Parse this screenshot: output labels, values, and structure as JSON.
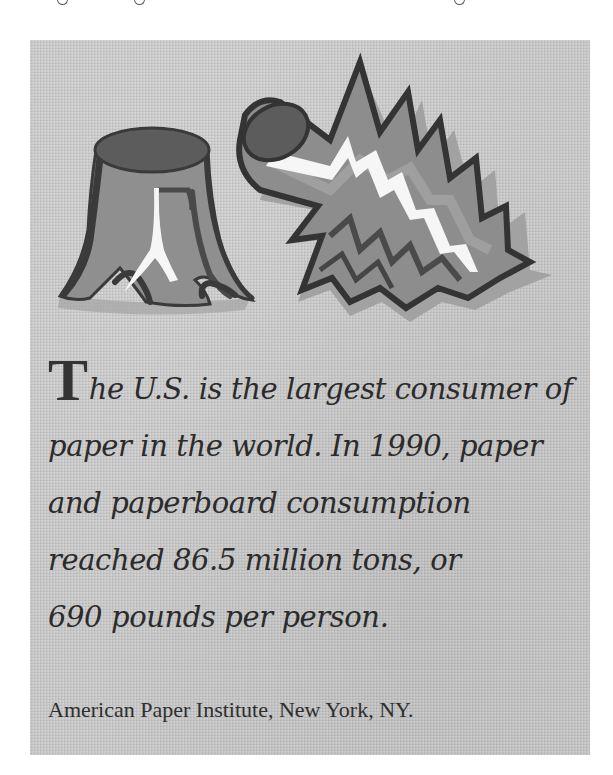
{
  "page": {
    "background_color": "#ffffff"
  },
  "panel": {
    "background_color": "#c9c9c9",
    "illustration": {
      "description": "Cartoon tree stump beside a felled log with jagged splintered break",
      "elements": [
        "tree-stump",
        "felled-log"
      ],
      "colors": {
        "body": "#8f8f8f",
        "top_face": "#5c5c5c",
        "outline": "#3a3a3a",
        "shadow": "#a8a8a8",
        "highlight": "#f6f6f6"
      }
    },
    "fact": {
      "drop_cap": "T",
      "lines": [
        "he U.S. is the largest consumer of",
        "paper in the world. In 1990, paper",
        "and paperboard consumption",
        "reached 86.5 million tons, or",
        "690 pounds per person."
      ]
    },
    "source": "American Paper Institute, New York, NY."
  }
}
